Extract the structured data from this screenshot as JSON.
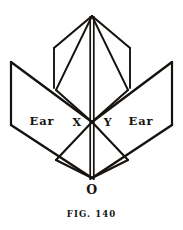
{
  "figure": {
    "caption": "FIG. 140",
    "stroke_color": "#16130f",
    "background_color": "#ffffff",
    "labels": {
      "left_ear": "Ear",
      "right_ear": "Ear",
      "point_x": "X",
      "point_y": "Y",
      "origin": "O"
    }
  },
  "diagram_data": {
    "type": "line-drawing",
    "description": "Geometric fold diagram with central vertical spine, two upper inner panels meeting at an apex, and two outward-spreading lower wing panels labelled Ear",
    "apex": {
      "x": 92,
      "y": 16
    },
    "center": {
      "x": 92,
      "y": 122
    },
    "origin_point": {
      "x": 92,
      "y": 178
    },
    "strokes": [
      {
        "name": "spine-left",
        "points": "90,16 90,180"
      },
      {
        "name": "spine-right",
        "points": "94,16 94,180"
      },
      {
        "name": "apex-to-inner-left-top",
        "points": "92,16 54,48"
      },
      {
        "name": "apex-to-inner-right-top",
        "points": "92,16 130,48"
      },
      {
        "name": "apex-to-inner-left-bottom",
        "points": "92,16 56,90"
      },
      {
        "name": "apex-to-inner-right-bottom",
        "points": "92,16 128,90"
      },
      {
        "name": "inner-left-vertical",
        "points": "54,48 54,88"
      },
      {
        "name": "inner-right-vertical",
        "points": "130,48 130,88"
      },
      {
        "name": "wing-left-top-edge",
        "points": "11,62 92,122"
      },
      {
        "name": "wing-right-top-edge",
        "points": "172,62 92,122"
      },
      {
        "name": "wing-left-outer-vertical",
        "points": "11,62 11,125"
      },
      {
        "name": "wing-right-outer-vertical",
        "points": "172,62 172,125"
      },
      {
        "name": "wing-left-bottom-edge",
        "points": "11,125 92,178"
      },
      {
        "name": "wing-right-bottom-edge",
        "points": "172,125 92,178"
      },
      {
        "name": "inner-fold-left",
        "points": "56,90 92,122"
      },
      {
        "name": "inner-fold-right",
        "points": "128,90 92,122"
      },
      {
        "name": "lower-fold-left",
        "points": "92,122 56,160"
      },
      {
        "name": "lower-fold-right",
        "points": "92,122 128,160"
      },
      {
        "name": "lower-fold-left-to-origin",
        "points": "56,160 92,178"
      },
      {
        "name": "lower-fold-right-to-origin",
        "points": "128,160 92,178"
      }
    ]
  }
}
